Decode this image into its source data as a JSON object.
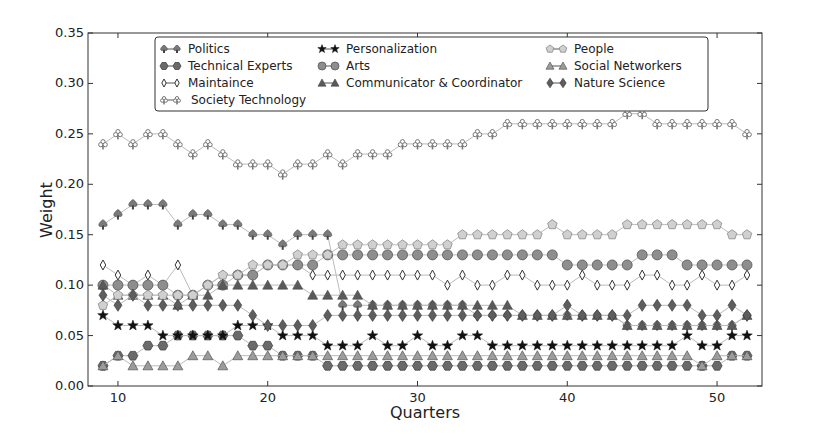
{
  "chart_data": {
    "type": "line",
    "title": "",
    "xlabel": "Quarters",
    "ylabel": "Weight",
    "xlim": [
      8,
      53
    ],
    "ylim": [
      0.0,
      0.35
    ],
    "x_ticks": [
      10,
      20,
      30,
      40,
      50
    ],
    "y_ticks": [
      "0.00",
      "0.05",
      "0.10",
      "0.15",
      "0.20",
      "0.25",
      "0.30",
      "0.35"
    ],
    "grid": false,
    "legend_position": "upper center (inside plot)",
    "x": [
      9,
      10,
      11,
      12,
      13,
      14,
      15,
      16,
      17,
      18,
      19,
      20,
      21,
      22,
      23,
      24,
      25,
      26,
      27,
      28,
      29,
      30,
      31,
      32,
      33,
      34,
      35,
      36,
      37,
      38,
      39,
      40,
      41,
      42,
      43,
      44,
      45,
      46,
      47,
      48,
      49,
      50,
      51,
      52
    ],
    "series": [
      {
        "name": "Politics",
        "marker": "spade",
        "color": "#7a7a7a",
        "values": [
          0.16,
          0.17,
          0.18,
          0.18,
          0.18,
          0.16,
          0.17,
          0.17,
          0.16,
          0.16,
          0.15,
          0.15,
          0.14,
          0.15,
          0.15,
          0.15,
          0.08,
          0.08,
          0.08,
          0.08,
          0.08,
          0.08,
          0.08,
          0.08,
          0.08,
          0.07,
          0.07,
          0.07,
          0.07,
          0.07,
          0.07,
          0.07,
          0.07,
          0.07,
          0.07,
          0.06,
          0.06,
          0.06,
          0.06,
          0.06,
          0.06,
          0.06,
          0.06,
          0.07
        ]
      },
      {
        "name": "Technical Experts",
        "marker": "hexagon",
        "color": "#6a6a6a",
        "values": [
          0.02,
          0.03,
          0.03,
          0.04,
          0.04,
          0.05,
          0.05,
          0.05,
          0.05,
          0.05,
          0.04,
          0.04,
          0.03,
          0.03,
          0.03,
          0.02,
          0.02,
          0.02,
          0.02,
          0.02,
          0.02,
          0.02,
          0.02,
          0.02,
          0.02,
          0.02,
          0.02,
          0.02,
          0.02,
          0.02,
          0.02,
          0.02,
          0.02,
          0.02,
          0.02,
          0.02,
          0.02,
          0.02,
          0.02,
          0.02,
          0.02,
          0.02,
          0.03,
          0.03
        ]
      },
      {
        "name": "Maintaince",
        "marker": "thin-diamond",
        "color": "#ffffff",
        "values": [
          0.12,
          0.11,
          0.1,
          0.11,
          0.1,
          0.12,
          0.09,
          0.1,
          0.11,
          0.11,
          0.11,
          0.12,
          0.12,
          0.12,
          0.11,
          0.11,
          0.11,
          0.11,
          0.11,
          0.11,
          0.11,
          0.11,
          0.11,
          0.1,
          0.11,
          0.1,
          0.1,
          0.11,
          0.11,
          0.1,
          0.1,
          0.1,
          0.11,
          0.1,
          0.1,
          0.1,
          0.11,
          0.11,
          0.1,
          0.1,
          0.11,
          0.1,
          0.1,
          0.11
        ]
      },
      {
        "name": "Society Technology",
        "marker": "club",
        "color": "#9a9a9a",
        "values": [
          0.24,
          0.25,
          0.24,
          0.25,
          0.25,
          0.24,
          0.23,
          0.24,
          0.23,
          0.22,
          0.22,
          0.22,
          0.21,
          0.22,
          0.22,
          0.23,
          0.22,
          0.23,
          0.23,
          0.23,
          0.24,
          0.24,
          0.24,
          0.24,
          0.24,
          0.25,
          0.25,
          0.26,
          0.26,
          0.26,
          0.26,
          0.26,
          0.26,
          0.26,
          0.26,
          0.27,
          0.27,
          0.26,
          0.26,
          0.26,
          0.26,
          0.26,
          0.26,
          0.25
        ]
      },
      {
        "name": "Personalization",
        "marker": "star",
        "color": "#1a1a1a",
        "values": [
          0.07,
          0.06,
          0.06,
          0.06,
          0.05,
          0.05,
          0.05,
          0.05,
          0.05,
          0.06,
          0.06,
          0.06,
          0.05,
          0.05,
          0.05,
          0.04,
          0.04,
          0.04,
          0.05,
          0.04,
          0.04,
          0.05,
          0.04,
          0.04,
          0.05,
          0.05,
          0.04,
          0.04,
          0.04,
          0.04,
          0.04,
          0.04,
          0.04,
          0.04,
          0.04,
          0.04,
          0.04,
          0.04,
          0.04,
          0.05,
          0.04,
          0.04,
          0.05,
          0.05
        ]
      },
      {
        "name": "Arts",
        "marker": "circle",
        "color": "#8e8e8e",
        "values": [
          0.1,
          0.1,
          0.1,
          0.1,
          0.1,
          0.09,
          0.09,
          0.1,
          0.1,
          0.11,
          0.11,
          0.12,
          0.12,
          0.12,
          0.12,
          0.13,
          0.13,
          0.13,
          0.13,
          0.13,
          0.13,
          0.13,
          0.13,
          0.13,
          0.13,
          0.13,
          0.13,
          0.13,
          0.13,
          0.13,
          0.13,
          0.12,
          0.12,
          0.12,
          0.12,
          0.12,
          0.13,
          0.13,
          0.13,
          0.12,
          0.12,
          0.12,
          0.12,
          0.12
        ]
      },
      {
        "name": "Communicator & Coordinator",
        "marker": "triangle",
        "color": "#5a5a5a",
        "values": [
          0.1,
          0.09,
          0.09,
          0.09,
          0.09,
          0.08,
          0.09,
          0.09,
          0.1,
          0.1,
          0.1,
          0.1,
          0.1,
          0.1,
          0.09,
          0.09,
          0.09,
          0.09,
          0.08,
          0.08,
          0.08,
          0.08,
          0.08,
          0.08,
          0.08,
          0.08,
          0.08,
          0.08,
          0.07,
          0.07,
          0.07,
          0.07,
          0.07,
          0.07,
          0.07,
          0.06,
          0.06,
          0.06,
          0.06,
          0.06,
          0.06,
          0.06,
          0.06,
          0.07
        ]
      },
      {
        "name": "People",
        "marker": "pentagon",
        "color": "#d0d0d0",
        "values": [
          0.08,
          0.09,
          0.09,
          0.09,
          0.09,
          0.09,
          0.09,
          0.1,
          0.11,
          0.11,
          0.12,
          0.12,
          0.12,
          0.13,
          0.13,
          0.13,
          0.14,
          0.14,
          0.14,
          0.14,
          0.14,
          0.14,
          0.14,
          0.14,
          0.15,
          0.15,
          0.15,
          0.15,
          0.15,
          0.15,
          0.16,
          0.15,
          0.15,
          0.15,
          0.15,
          0.16,
          0.16,
          0.16,
          0.16,
          0.16,
          0.16,
          0.16,
          0.15,
          0.15
        ]
      },
      {
        "name": "Social Networkers",
        "marker": "triangle",
        "color": "#9c9c9c",
        "values": [
          0.02,
          0.03,
          0.02,
          0.02,
          0.02,
          0.02,
          0.03,
          0.03,
          0.02,
          0.03,
          0.03,
          0.03,
          0.03,
          0.03,
          0.03,
          0.03,
          0.03,
          0.03,
          0.03,
          0.03,
          0.03,
          0.03,
          0.03,
          0.03,
          0.03,
          0.03,
          0.03,
          0.03,
          0.03,
          0.03,
          0.03,
          0.03,
          0.03,
          0.03,
          0.03,
          0.03,
          0.03,
          0.03,
          0.03,
          0.03,
          0.02,
          0.03,
          0.03,
          0.03
        ]
      },
      {
        "name": "Nature Science",
        "marker": "diamond",
        "color": "#5e5e5e",
        "values": [
          0.09,
          0.08,
          0.09,
          0.08,
          0.08,
          0.08,
          0.08,
          0.08,
          0.08,
          0.08,
          0.07,
          0.06,
          0.06,
          0.06,
          0.06,
          0.07,
          0.07,
          0.07,
          0.07,
          0.07,
          0.07,
          0.07,
          0.07,
          0.07,
          0.07,
          0.07,
          0.07,
          0.07,
          0.07,
          0.07,
          0.07,
          0.08,
          0.07,
          0.07,
          0.07,
          0.07,
          0.08,
          0.08,
          0.08,
          0.08,
          0.07,
          0.07,
          0.08,
          0.07
        ]
      }
    ],
    "legend_columns": [
      [
        "Politics",
        "Technical Experts",
        "Maintaince",
        "Society Technology"
      ],
      [
        "Personalization",
        "Arts",
        "Communicator & Coordinator"
      ],
      [
        "People",
        "Social Networkers",
        "Nature Science"
      ]
    ]
  }
}
